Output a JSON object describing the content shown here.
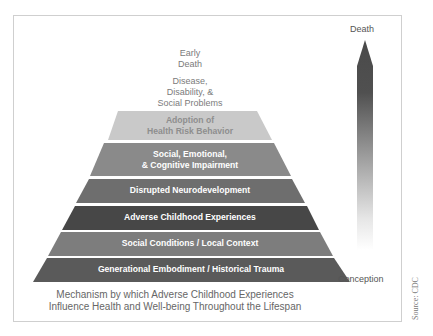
{
  "diagram": {
    "type": "pyramid",
    "top_labels": [
      {
        "id": "early-death",
        "lines": [
          "Early",
          "Death"
        ]
      },
      {
        "id": "disease",
        "lines": [
          "Disease,",
          "Disability, &",
          "Social Problems"
        ]
      }
    ],
    "layers": [
      {
        "id": "adoption",
        "lines": [
          "Adoption of",
          "Health Risk Behavior"
        ],
        "color": "#c9c9c9"
      },
      {
        "id": "social-emotional",
        "lines": [
          "Social, Emotional,",
          "& Cognitive Impairment"
        ],
        "color": "#8a8a8a"
      },
      {
        "id": "disrupted",
        "lines": [
          "Disrupted Neurodevelopment"
        ],
        "color": "#6e6e6e"
      },
      {
        "id": "ace",
        "lines": [
          "Adverse Childhood Experiences"
        ],
        "color": "#474747"
      },
      {
        "id": "social-conditions",
        "lines": [
          "Social Conditions / Local Context"
        ],
        "color": "#7d7d7d"
      },
      {
        "id": "generational",
        "lines": [
          "Generational Embodiment / Historical Trauma"
        ],
        "color": "#5a5a5a"
      }
    ],
    "caption": [
      "Mechanism by which Adverse Childhood Experiences",
      "Influence Health and Well-being Throughout the Lifespan"
    ],
    "arrow": {
      "top_label": "Death",
      "bottom_label": "Conception",
      "color_top": "#4a4a4a"
    },
    "source": "Source: CDC"
  }
}
